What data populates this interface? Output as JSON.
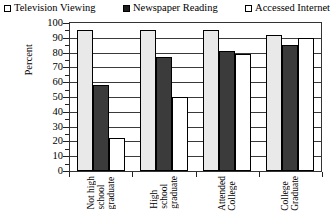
{
  "chart_data": {
    "type": "bar",
    "title": "",
    "xlabel": "",
    "ylabel": "Percent",
    "ylim": [
      0,
      100
    ],
    "ytick_step": 10,
    "grid": true,
    "legend_position": "top",
    "categories": [
      "Not high school graduate",
      "High school graduate",
      "Attended College",
      "College Graduate"
    ],
    "category_words": [
      [
        "Not high",
        "school",
        "graduate"
      ],
      [
        "High",
        "school",
        "graduate"
      ],
      [
        "Attended",
        "College"
      ],
      [
        "College",
        "Graduate"
      ]
    ],
    "series": [
      {
        "name": "Television Viewing",
        "swatch": "white",
        "color": "#e9e9e9",
        "values": [
          95,
          95,
          95,
          92
        ]
      },
      {
        "name": "Newspaper Reading",
        "swatch": "black",
        "color": "#3b3b3b",
        "values": [
          58,
          77,
          81,
          85
        ]
      },
      {
        "name": "Accessed Internet",
        "swatch": "white",
        "color": "#ffffff",
        "values": [
          22,
          50,
          79,
          90
        ]
      }
    ],
    "ytick_labels": [
      "100",
      "90",
      "80",
      "70",
      "60",
      "50",
      "40",
      "30",
      "20",
      "10",
      "0"
    ]
  },
  "legend": {
    "items": [
      {
        "label": "Television Viewing"
      },
      {
        "label": "Newspaper Reading"
      },
      {
        "label": "Accessed Internet"
      }
    ]
  },
  "axis": {
    "y_title": "Percent"
  }
}
